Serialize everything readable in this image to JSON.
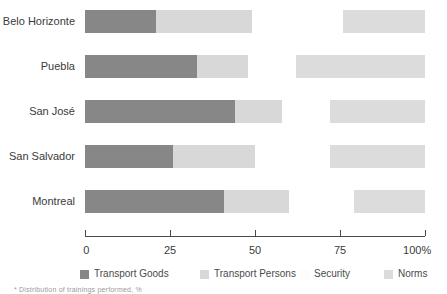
{
  "chart_data": {
    "type": "bar",
    "title": "",
    "subtitle": "",
    "xlabel": "",
    "ylabel": "",
    "orientation": "horizontal",
    "stacked": true,
    "grid": false,
    "legend_position": "bottom",
    "xlim": [
      0,
      100
    ],
    "xticks": [
      0,
      25,
      50,
      75,
      100
    ],
    "xticklabels": [
      "0",
      "25",
      "50",
      "75",
      "100%"
    ],
    "categories": [
      "Belo Horizonte",
      "Puebla",
      "San José",
      "San Salvador",
      "Montreal"
    ],
    "series": [
      {
        "name": "Transport Goods",
        "color": "#878787",
        "values": [
          21,
          33,
          44,
          26,
          41
        ]
      },
      {
        "name": "Transport Persons",
        "color": "#d8d8d8",
        "values": [
          28,
          15,
          14,
          24,
          19
        ]
      },
      {
        "name": "Security",
        "color": "#ffffff",
        "values": [
          27,
          14,
          14,
          22,
          19
        ]
      },
      {
        "name": "Norms",
        "color": "#dcdcdc",
        "values": [
          24,
          38,
          28,
          28,
          21
        ]
      }
    ],
    "segment_spans": [
      {
        "category": "Belo Horizonte",
        "goods": [
          0,
          21
        ],
        "persons": [
          21,
          49
        ],
        "security": [
          49,
          76
        ],
        "norms": [
          76,
          100
        ]
      },
      {
        "category": "Puebla",
        "goods": [
          0,
          33
        ],
        "persons": [
          33,
          48
        ],
        "security": [
          48,
          62
        ],
        "norms": [
          62,
          100
        ]
      },
      {
        "category": "San José",
        "goods": [
          0,
          44
        ],
        "persons": [
          44,
          58
        ],
        "security": [
          58,
          72
        ],
        "norms": [
          72,
          100
        ]
      },
      {
        "category": "San Salvador",
        "goods": [
          0,
          26
        ],
        "persons": [
          26,
          50
        ],
        "security": [
          50,
          72
        ],
        "norms": [
          72,
          100
        ]
      },
      {
        "category": "Montreal",
        "goods": [
          0,
          41
        ],
        "persons": [
          41,
          60
        ],
        "security": [
          60,
          79
        ],
        "norms": [
          79,
          100
        ]
      }
    ]
  },
  "axis": {
    "ticks": [
      {
        "value": 0,
        "label": "0"
      },
      {
        "value": 25,
        "label": "25"
      },
      {
        "value": 50,
        "label": "50"
      },
      {
        "value": 75,
        "label": "75"
      },
      {
        "value": 100,
        "label": "100%"
      }
    ]
  },
  "legend": {
    "items": [
      {
        "label": "Transport Goods",
        "color": "#878787",
        "swatch": true
      },
      {
        "label": "Transport Persons",
        "color": "#d8d8d8",
        "swatch": true
      },
      {
        "label": "Security",
        "color": "#fdfdfd",
        "swatch": true
      },
      {
        "label": "Norms",
        "color": "#dcdcdc",
        "swatch": true
      }
    ]
  },
  "footnote": {
    "text": "* Distribution of trainings performed, %"
  },
  "colors": {
    "goods": "#878787",
    "persons": "#d8d8d8",
    "security": "#ffffff",
    "norms": "#dcdcdc",
    "axis": "#4a4a4a",
    "text": "#3b3b3b"
  }
}
